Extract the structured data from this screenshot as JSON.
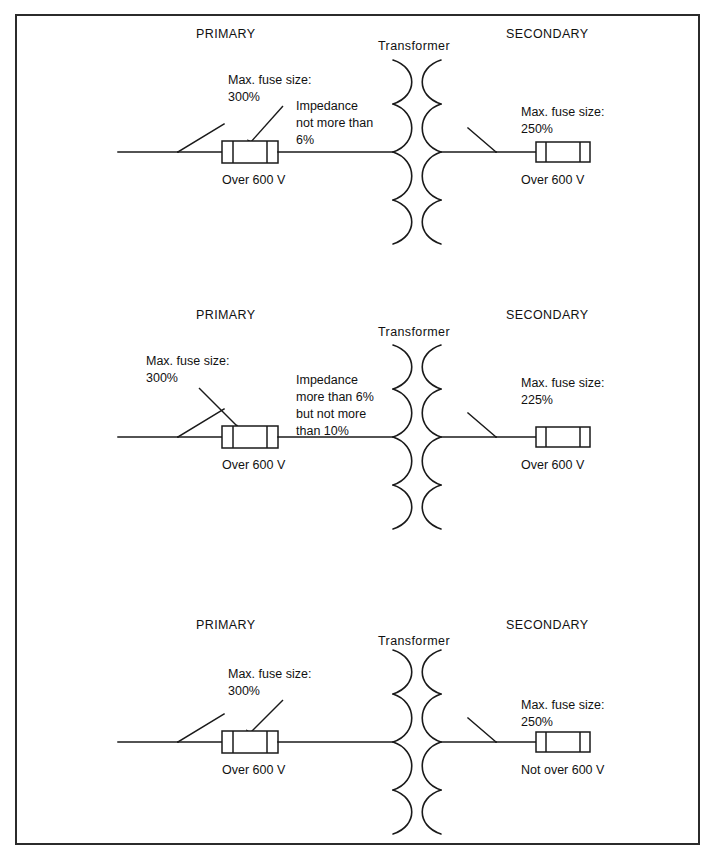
{
  "figure": {
    "border_color": "#2b2b2b",
    "line_color": "#1a1a1a",
    "background": "#ffffff",
    "blocks": [
      {
        "id": "block-1",
        "primary_label": "PRIMARY",
        "transformer_label": "Transformer",
        "secondary_label": "SECONDARY",
        "primary_fuse_caption_line1": "Max. fuse size:",
        "primary_fuse_caption_line2": "300%",
        "primary_voltage": "Over 600 V",
        "impedance_line1": "Impedance",
        "impedance_line2": "not more than",
        "impedance_line3": "6%",
        "secondary_fuse_caption_line1": "Max. fuse size:",
        "secondary_fuse_caption_line2": "250%",
        "secondary_voltage": "Over 600 V"
      },
      {
        "id": "block-2",
        "primary_label": "PRIMARY",
        "transformer_label": "Transformer",
        "secondary_label": "SECONDARY",
        "primary_fuse_caption_line1": "Max. fuse size:",
        "primary_fuse_caption_line2": "300%",
        "primary_voltage": "Over 600 V",
        "impedance_line1": "Impedance",
        "impedance_line2": "more than 6%",
        "impedance_line3": "but not more",
        "impedance_line4": "than 10%",
        "secondary_fuse_caption_line1": "Max. fuse size:",
        "secondary_fuse_caption_line2": "225%",
        "secondary_voltage": "Over 600 V"
      },
      {
        "id": "block-3",
        "primary_label": "PRIMARY",
        "transformer_label": "Transformer",
        "secondary_label": "SECONDARY",
        "primary_fuse_caption_line1": "Max. fuse size:",
        "primary_fuse_caption_line2": "300%",
        "primary_voltage": "Over 600 V",
        "secondary_fuse_caption_line1": "Max. fuse size:",
        "secondary_fuse_caption_line2": "250%",
        "secondary_voltage": "Not over 600 V"
      }
    ]
  }
}
